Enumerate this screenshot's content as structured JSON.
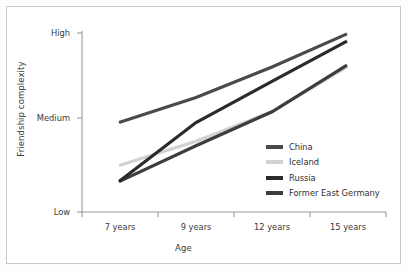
{
  "chart_data": {
    "type": "line",
    "title": "",
    "xlabel": "Age",
    "ylabel": "Friendship complexity",
    "categories": [
      "7 years",
      "9 years",
      "12 years",
      "15 years"
    ],
    "x_tick_labels": [
      "7 years",
      "9 years",
      "12 years",
      "15 years"
    ],
    "y_tick_labels": [
      "Low",
      "Medium",
      "High"
    ],
    "y_tick_values": [
      0,
      1,
      2
    ],
    "ylim": [
      0,
      2
    ],
    "grid": false,
    "legend_position": "center-right",
    "series": [
      {
        "name": "China",
        "color": "#4a4a4a",
        "values": [
          1.0,
          1.28,
          1.62,
          1.99
        ]
      },
      {
        "name": "Iceland",
        "color": "#d2d2d2",
        "values": [
          0.52,
          0.79,
          1.12,
          1.62
        ]
      },
      {
        "name": "Russia",
        "color": "#2b2b2b",
        "values": [
          0.34,
          1.0,
          1.46,
          1.91
        ]
      },
      {
        "name": "Former East Germany",
        "color": "#3d3d3d",
        "values": [
          0.34,
          0.74,
          1.12,
          1.64
        ]
      }
    ]
  },
  "legend": {
    "items": [
      {
        "label": "China",
        "swatch_color": "#4a4a4a"
      },
      {
        "label": "Iceland",
        "swatch_color": "#d2d2d2"
      },
      {
        "label": "Russia",
        "swatch_color": "#2b2b2b"
      },
      {
        "label": "Former East Germany",
        "swatch_color": "#3d3d3d"
      }
    ]
  },
  "axes": {
    "y_label": "Friendship complexity",
    "x_label": "Age",
    "y_ticks": [
      "High",
      "Medium",
      "Low"
    ],
    "x_ticks": [
      "7 years",
      "9 years",
      "12 years",
      "15 years"
    ],
    "axis_color": "#9a9a9a"
  }
}
